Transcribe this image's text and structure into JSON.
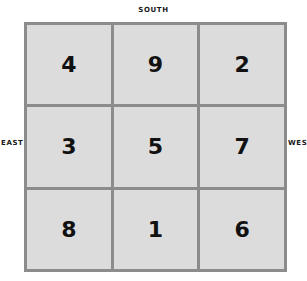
{
  "directions": {
    "top": "SOUTH",
    "left": "EAST",
    "right": "WEST"
  },
  "magic_square": {
    "rows": [
      [
        "4",
        "9",
        "2"
      ],
      [
        "3",
        "5",
        "7"
      ],
      [
        "8",
        "1",
        "6"
      ]
    ]
  },
  "colors": {
    "cell_fill": "#dcdcdc",
    "grid_line": "#8c8c8c",
    "text": "#111111"
  }
}
